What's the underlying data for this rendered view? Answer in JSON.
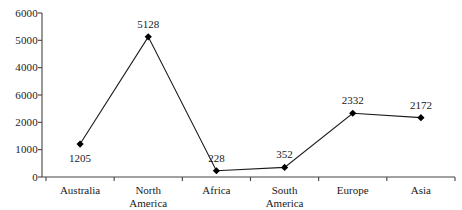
{
  "chart_data": {
    "type": "line",
    "title": "",
    "xlabel": "",
    "ylabel": "",
    "categories": [
      "Australia",
      "North America",
      "Africa",
      "South America",
      "Europe",
      "Asia"
    ],
    "values": [
      1205,
      5128,
      228,
      352,
      2332,
      2172
    ],
    "point_labels": [
      "1205",
      "5128",
      "228",
      "352",
      "2332",
      "2172"
    ],
    "ylim": [
      0,
      6000
    ],
    "ytick_values": [
      6000,
      5000,
      4000,
      3000,
      2000,
      1000,
      0
    ],
    "ytick_labels": [
      "6000",
      "5000",
      "4000",
      "6000",
      "2000",
      "1000",
      "0"
    ],
    "grid": false,
    "legend": false,
    "marker": "diamond",
    "line_color": "#1a1a1a",
    "marker_color": "#000000",
    "axis_color": "#444444",
    "background_color": "#ffffff"
  },
  "axes": {
    "category_lines": [
      [
        "Australia"
      ],
      [
        "North",
        "America"
      ],
      [
        "Africa"
      ],
      [
        "South",
        "America"
      ],
      [
        "Europe"
      ],
      [
        "Asia"
      ]
    ]
  }
}
